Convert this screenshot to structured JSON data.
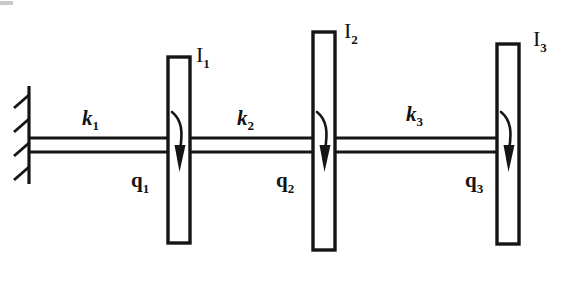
{
  "figure": {
    "ink_color": "#151515",
    "background_color": "#ffffff",
    "width": 574,
    "height": 283
  },
  "support": {
    "name": "fixed-wall",
    "hatch_count": 4
  },
  "shafts": [
    {
      "id": "k1",
      "base": "k",
      "sub": "1",
      "label_x": 82,
      "label_y": 108
    },
    {
      "id": "k2",
      "base": "k",
      "sub": "2",
      "label_x": 237,
      "label_y": 108
    },
    {
      "id": "k3",
      "base": "k",
      "sub": "3",
      "label_x": 406,
      "label_y": 104
    }
  ],
  "disks": [
    {
      "id": "I1",
      "base": "I",
      "sub": "1",
      "label_x": 196,
      "label_y": 44
    },
    {
      "id": "I2",
      "base": "I",
      "sub": "2",
      "label_x": 344,
      "label_y": 20
    },
    {
      "id": "I3",
      "base": "I",
      "sub": "3",
      "label_x": 533,
      "label_y": 28
    }
  ],
  "coordinates": [
    {
      "id": "q1",
      "base": "q",
      "sub": "1",
      "label_x": 131,
      "label_y": 170
    },
    {
      "id": "q2",
      "base": "q",
      "sub": "2",
      "label_x": 276,
      "label_y": 170
    },
    {
      "id": "q3",
      "base": "q",
      "sub": "3",
      "label_x": 465,
      "label_y": 170
    }
  ],
  "torque_arrows": [
    {
      "id": "torque-1",
      "disk": "I1",
      "direction": "clockwise-down"
    },
    {
      "id": "torque-2",
      "disk": "I2",
      "direction": "clockwise-down"
    },
    {
      "id": "torque-3",
      "disk": "I3",
      "direction": "clockwise-down"
    }
  ]
}
